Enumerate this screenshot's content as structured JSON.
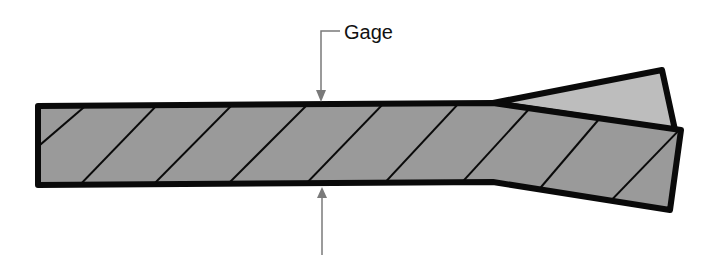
{
  "diagram": {
    "type": "cross-section",
    "label": "Gage",
    "colors": {
      "background": "#ffffff",
      "outline": "#0a0a0a",
      "body_fill": "#9a9a9a",
      "wedge_fill": "#bdbdbd",
      "arrow": "#7a7a7a"
    },
    "parts": [
      {
        "name": "main-bar",
        "description": "Hatched rectangular section"
      },
      {
        "name": "lower-flange",
        "description": "Hatched section angled down at right end"
      },
      {
        "name": "upper-wedge",
        "description": "Lighter triangular piece splitting from the bar at right end"
      }
    ],
    "dimension": {
      "name": "gage-thickness",
      "label": "Gage",
      "top_arrow": "points down to top surface",
      "bottom_arrow": "points up to bottom surface"
    }
  }
}
